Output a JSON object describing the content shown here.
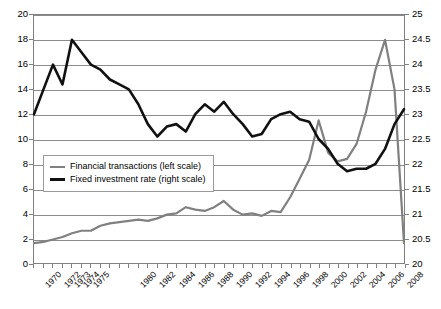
{
  "chart_data": {
    "type": "line",
    "title": "",
    "xlabel": "",
    "ylabel": "",
    "ylim": [
      0,
      20
    ],
    "y2lim": [
      20,
      25
    ],
    "grid": true,
    "legend_position": "inside-left-middle",
    "x_tick_labels": [
      "1970",
      "1972",
      "1973",
      "1974",
      "1975",
      "1980",
      "1982",
      "1984",
      "1986",
      "1988",
      "1990",
      "1992",
      "1994",
      "1996",
      "1998",
      "2000",
      "2002",
      "2004",
      "2006",
      "2008"
    ],
    "y_left_ticks": [
      "0",
      "2",
      "4",
      "6",
      "8",
      "10",
      "12",
      "14",
      "16",
      "18",
      "20"
    ],
    "y_right_ticks": [
      "20",
      "20.5",
      "21",
      "21.5",
      "22",
      "22.5",
      "23",
      "23.5",
      "24",
      "24.5",
      "25"
    ],
    "x": [
      1970,
      1971,
      1972,
      1973,
      1974,
      1975,
      1976,
      1977,
      1978,
      1979,
      1980,
      1981,
      1982,
      1983,
      1984,
      1985,
      1986,
      1987,
      1988,
      1989,
      1990,
      1991,
      1992,
      1993,
      1994,
      1995,
      1996,
      1997,
      1998,
      1999,
      2000,
      2001,
      2002,
      2003,
      2004,
      2005,
      2006,
      2007,
      2008,
      2009
    ],
    "series": [
      {
        "name": "Financial transactions (left scale)",
        "axis": "left",
        "color": "#808080",
        "values": [
          1.6,
          1.7,
          1.9,
          2.1,
          2.4,
          2.6,
          2.6,
          3.0,
          3.2,
          3.3,
          3.4,
          3.5,
          3.4,
          3.6,
          3.9,
          4.0,
          4.5,
          4.3,
          4.2,
          4.5,
          5.0,
          4.3,
          3.9,
          4.0,
          3.8,
          4.2,
          4.1,
          5.3,
          6.8,
          8.3,
          11.5,
          8.9,
          8.2,
          8.4,
          9.6,
          12.2,
          15.6,
          18.0,
          14.0,
          1.6
        ]
      },
      {
        "name": "Fixed investment rate (right scale)",
        "axis": "right",
        "color": "#111111",
        "values": [
          23.0,
          23.5,
          24.0,
          23.6,
          24.5,
          24.25,
          24.0,
          23.9,
          23.7,
          23.6,
          23.5,
          23.2,
          22.8,
          22.55,
          22.75,
          22.8,
          22.65,
          23.0,
          23.2,
          23.05,
          23.25,
          23.0,
          22.8,
          22.55,
          22.6,
          22.9,
          23.0,
          23.05,
          22.9,
          22.85,
          22.5,
          22.3,
          22.0,
          21.85,
          21.9,
          21.9,
          22.0,
          22.3,
          22.8,
          23.1
        ]
      }
    ]
  },
  "legend": {
    "entries": [
      {
        "label": "Financial transactions (left scale)",
        "swatch": "gray-line-swatch"
      },
      {
        "label": "Fixed investment rate (right scale)",
        "swatch": "black-line-swatch"
      }
    ]
  }
}
